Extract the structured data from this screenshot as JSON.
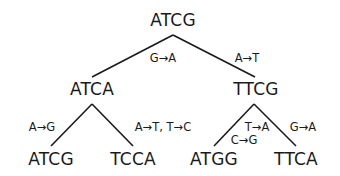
{
  "diagram": {
    "type": "phylogenetic-mutation-tree",
    "root": {
      "label": "ATCG"
    },
    "level1": [
      {
        "label": "ATCA",
        "edge_label": "G→A"
      },
      {
        "label": "TTCG",
        "edge_label": "A→T"
      }
    ],
    "level2": [
      {
        "label": "ATCG",
        "parent": "ATCA",
        "edge_label": "A→G"
      },
      {
        "label": "TCCA",
        "parent": "ATCA",
        "edge_label": "A→T, T→C"
      },
      {
        "label": "ATGG",
        "parent": "TTCG",
        "edge_label_line1": "T→A",
        "edge_label_line2": "C→G"
      },
      {
        "label": "TTCA",
        "parent": "TTCG",
        "edge_label": "G→A"
      }
    ],
    "colors": {
      "line": "#1a1a1a",
      "background": "#ffffff"
    }
  }
}
